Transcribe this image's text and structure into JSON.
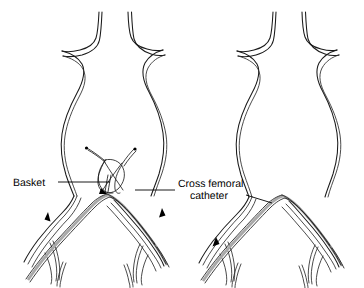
{
  "figure": {
    "background_color": "#ffffff",
    "line_color": "#1a1a1a",
    "catheter_shade_color": "#a8a8a8",
    "label_color": "#000000"
  },
  "labels": {
    "basket": "Basket",
    "cross_femoral_line1": "Cross femoral",
    "cross_femoral_line2": "catheter"
  },
  "panels": [
    {
      "id": "left",
      "name": "panel-left-basket-capture",
      "has_basket": true,
      "has_cross_femoral_catheter": true,
      "flow_arrows": [
        {
          "name": "flow-arrow-left-iliac",
          "direction": "up"
        },
        {
          "name": "flow-arrow-right-iliac",
          "direction": "up"
        }
      ]
    },
    {
      "id": "right",
      "name": "panel-right-catheter-pulled-through",
      "has_basket": false,
      "has_cross_femoral_catheter": true,
      "flow_arrows": [
        {
          "name": "flow-arrow-left-iliac",
          "direction": "down"
        }
      ]
    }
  ],
  "anatomy": {
    "aorta": "infrarenal abdominal aortic aneurysm sac",
    "branches": "renal arteries",
    "bifurcation": "aortic bifurcation into common iliac arteries",
    "distal": "external and internal iliac arteries"
  }
}
